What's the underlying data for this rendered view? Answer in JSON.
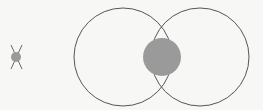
{
  "diagram": {
    "type": "venn-intersection",
    "colors": {
      "background": "#f7f7f5",
      "outline": "#555555",
      "fill": "#9a9a9a"
    },
    "legend_icon": {
      "cx": 16,
      "cy": 57,
      "r": 5
    },
    "circles": [
      {
        "name": "left",
        "cx": 123,
        "cy": 57,
        "r": 49
      },
      {
        "name": "right",
        "cx": 200,
        "cy": 57,
        "r": 49
      }
    ],
    "intersection_disc": {
      "cx": 162,
      "cy": 57,
      "r": 19
    }
  }
}
